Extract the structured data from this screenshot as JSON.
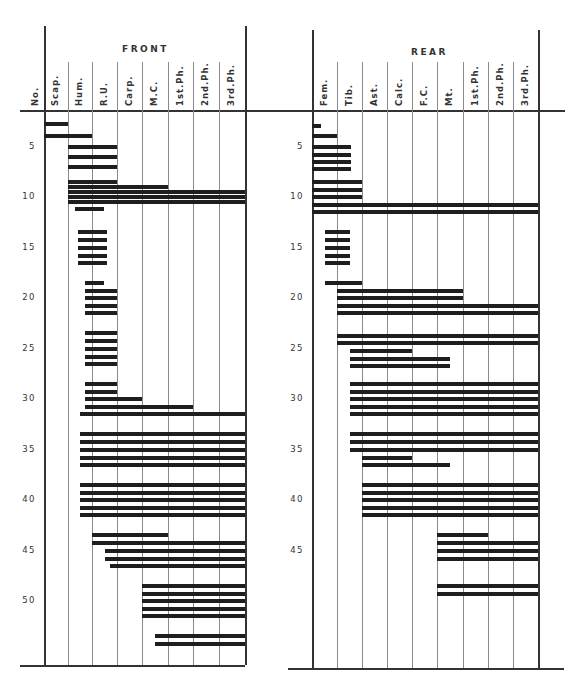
{
  "chart_data": {
    "type": "table",
    "row_axis": {
      "label": "No.",
      "ticks": [
        5,
        10,
        15,
        20,
        25,
        30,
        35,
        40,
        45,
        50
      ]
    },
    "panels": [
      {
        "name": "FRONT",
        "columns": [
          "Scap.",
          "Hum.",
          "R.U.",
          "Carp.",
          "M.C.",
          "1st.Ph.",
          "2nd.Ph.",
          "3rd.Ph."
        ],
        "bars_note": "each bar: [stage_row, first_column_index(0-based, fractional), last_column_edge]",
        "bars": [
          [
            2.8,
            0,
            1
          ],
          [
            4,
            0,
            2
          ],
          [
            5,
            1,
            3
          ],
          [
            6,
            1,
            3
          ],
          [
            7,
            1,
            3
          ],
          [
            8.5,
            1,
            3
          ],
          [
            9,
            1,
            5
          ],
          [
            9.5,
            1,
            8
          ],
          [
            10,
            1,
            8
          ],
          [
            10.5,
            1,
            8
          ],
          [
            11.2,
            1.3,
            2.5
          ],
          [
            13.5,
            1.4,
            2.6
          ],
          [
            14.3,
            1.4,
            2.6
          ],
          [
            15,
            1.4,
            2.6
          ],
          [
            15.8,
            1.4,
            2.6
          ],
          [
            16.5,
            1.4,
            2.6
          ],
          [
            18.5,
            1.7,
            2.5
          ],
          [
            19.3,
            1.7,
            3
          ],
          [
            20,
            1.7,
            3
          ],
          [
            20.8,
            1.7,
            3
          ],
          [
            21.5,
            1.7,
            3
          ],
          [
            23.5,
            1.7,
            3
          ],
          [
            24.3,
            1.7,
            3
          ],
          [
            25,
            1.7,
            3
          ],
          [
            25.8,
            1.7,
            3
          ],
          [
            26.5,
            1.7,
            3
          ],
          [
            28.5,
            1.7,
            3
          ],
          [
            29.3,
            1.7,
            3
          ],
          [
            30,
            1.7,
            4
          ],
          [
            30.8,
            1.7,
            6
          ],
          [
            31.5,
            1.5,
            8
          ],
          [
            33.5,
            1.5,
            8
          ],
          [
            34.3,
            1.5,
            8
          ],
          [
            35,
            1.5,
            8
          ],
          [
            35.8,
            1.5,
            8
          ],
          [
            36.5,
            1.5,
            8
          ],
          [
            38.5,
            1.5,
            8
          ],
          [
            39.3,
            1.5,
            8
          ],
          [
            40,
            1.5,
            8
          ],
          [
            40.8,
            1.5,
            8
          ],
          [
            41.5,
            1.5,
            8
          ],
          [
            43.5,
            2,
            5
          ],
          [
            44.3,
            2,
            8
          ],
          [
            45,
            2.5,
            8
          ],
          [
            45.8,
            2.5,
            8
          ],
          [
            46.5,
            2.7,
            8
          ],
          [
            48.5,
            4,
            8
          ],
          [
            49.3,
            4,
            8
          ],
          [
            50,
            4,
            8
          ],
          [
            50.8,
            4,
            8
          ],
          [
            51.5,
            4,
            8
          ],
          [
            53.5,
            4.5,
            8
          ],
          [
            54.3,
            4.5,
            8
          ]
        ]
      },
      {
        "name": "REAR",
        "columns": [
          "Fem.",
          "Tib.",
          "Ast.",
          "Calc.",
          "F.C.",
          "Mt.",
          "1st.Ph.",
          "2nd.Ph.",
          "3rd.Ph."
        ],
        "bars": [
          [
            3,
            0,
            0.35
          ],
          [
            4,
            0,
            1
          ],
          [
            5,
            0,
            1.55
          ],
          [
            5.8,
            0,
            1.55
          ],
          [
            6.5,
            0,
            1.55
          ],
          [
            7.2,
            0,
            1.55
          ],
          [
            8.5,
            0,
            2
          ],
          [
            9.3,
            0,
            2
          ],
          [
            10,
            0,
            2
          ],
          [
            10.8,
            0,
            9
          ],
          [
            11.5,
            0,
            9
          ],
          [
            13.5,
            0.5,
            1.5
          ],
          [
            14.3,
            0.5,
            1.5
          ],
          [
            15,
            0.5,
            1.5
          ],
          [
            15.8,
            0.5,
            1.5
          ],
          [
            16.5,
            0.5,
            1.5
          ],
          [
            18.5,
            0.5,
            2
          ],
          [
            19.3,
            1,
            6
          ],
          [
            20,
            1,
            6
          ],
          [
            20.8,
            1,
            9
          ],
          [
            21.5,
            1,
            9
          ],
          [
            23.8,
            1,
            9
          ],
          [
            24.5,
            1,
            9
          ],
          [
            25.2,
            1.5,
            4
          ],
          [
            26,
            1.5,
            5.5
          ],
          [
            26.7,
            1.5,
            5.5
          ],
          [
            28.5,
            1.5,
            9
          ],
          [
            29.3,
            1.5,
            9
          ],
          [
            30,
            1.5,
            9
          ],
          [
            30.8,
            1.5,
            9
          ],
          [
            31.5,
            1.5,
            9
          ],
          [
            33.5,
            1.5,
            9
          ],
          [
            34.3,
            1.5,
            9
          ],
          [
            35,
            1.5,
            9
          ],
          [
            35.8,
            2,
            4
          ],
          [
            36.5,
            2,
            5.5
          ],
          [
            38.5,
            2,
            9
          ],
          [
            39.3,
            2,
            9
          ],
          [
            40,
            2,
            9
          ],
          [
            40.8,
            2,
            9
          ],
          [
            41.5,
            2,
            9
          ],
          [
            43.5,
            5,
            7
          ],
          [
            44.3,
            5,
            9
          ],
          [
            45,
            5,
            9
          ],
          [
            45.8,
            5,
            9
          ],
          [
            48.5,
            5,
            9
          ],
          [
            49.3,
            5,
            9
          ]
        ]
      }
    ],
    "xlabel": "",
    "ylabel": "No.",
    "grid": true
  },
  "labels": {
    "row_header": "No.",
    "front_title": "FRONT",
    "rear_title": "REAR",
    "front_columns": [
      "Scap.",
      "Hum.",
      "R.U.",
      "Carp.",
      "M.C.",
      "1st.Ph.",
      "2nd.Ph.",
      "3rd.Ph."
    ],
    "rear_columns": [
      "Fem.",
      "Tib.",
      "Ast.",
      "Calc.",
      "F.C.",
      "Mt.",
      "1st.Ph.",
      "2nd.Ph.",
      "3rd.Ph."
    ],
    "row_ticks": [
      "5",
      "10",
      "15",
      "20",
      "25",
      "30",
      "35",
      "40",
      "45",
      "50"
    ]
  }
}
